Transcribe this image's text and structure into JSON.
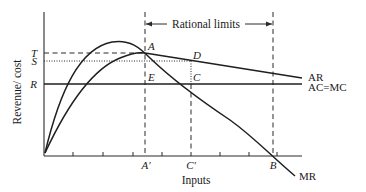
{
  "diagram": {
    "y_axis_label": "Revenue/ cost",
    "x_axis_label": "Inputs",
    "bracket_label": "Rational limits",
    "y_levels": [
      {
        "label": "T",
        "style": "dashed"
      },
      {
        "label": "S",
        "style": "dotted"
      },
      {
        "label": "R",
        "style": "solid"
      }
    ],
    "x_markers": [
      {
        "label": "A′"
      },
      {
        "label": "C′"
      },
      {
        "label": "B"
      }
    ],
    "points": [
      {
        "label": "A"
      },
      {
        "label": "D"
      },
      {
        "label": "E"
      },
      {
        "label": "C"
      }
    ],
    "curves": [
      {
        "label": "AR",
        "description": "Average revenue: rises to a maximum at A, then declines slowly"
      },
      {
        "label": "AC=MC",
        "description": "Constant average cost = marginal cost, horizontal at R"
      },
      {
        "label": "MR",
        "description": "Marginal revenue: rises to a peak then falls, cutting AC=MC at C and the input axis at B"
      }
    ]
  }
}
